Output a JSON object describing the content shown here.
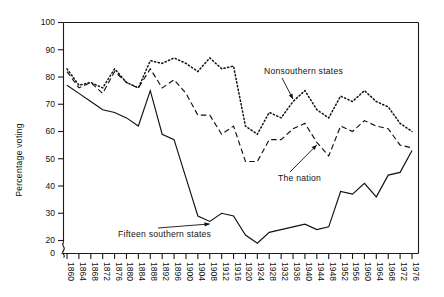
{
  "chart_data": {
    "type": "line",
    "title": "",
    "xlabel": "",
    "ylabel": "Percentage voting",
    "ylim": [
      20,
      100
    ],
    "y_axis_break_to_zero": true,
    "grid": false,
    "legend_position": "inline-annotations",
    "x": [
      1860,
      1864,
      1868,
      1872,
      1876,
      1880,
      1884,
      1888,
      1892,
      1896,
      1900,
      1904,
      1908,
      1912,
      1916,
      1920,
      1924,
      1928,
      1932,
      1936,
      1940,
      1944,
      1948,
      1952,
      1956,
      1960,
      1964,
      1968,
      1972,
      1976
    ],
    "categories": [
      "1860",
      "1864",
      "1868",
      "1872",
      "1876",
      "1880",
      "1884",
      "1888",
      "1892",
      "1896",
      "1900",
      "1904",
      "1908",
      "1912",
      "1916",
      "1920",
      "1924",
      "1928",
      "1932",
      "1936",
      "1940",
      "1944",
      "1948",
      "1952",
      "1956",
      "1960",
      "1964",
      "1968",
      "1972",
      "1976"
    ],
    "y_ticks": [
      0,
      20,
      30,
      40,
      50,
      60,
      70,
      80,
      90,
      100
    ],
    "y_tick_labels": [
      "0",
      "20",
      "30",
      "40",
      "50",
      "60",
      "70",
      "80",
      "90",
      "100"
    ],
    "series": [
      {
        "name": "Nonsouthern states",
        "style": "dotted",
        "values": [
          83,
          77,
          78,
          76,
          83,
          78,
          76,
          86,
          85,
          87,
          85,
          82,
          87,
          83,
          84,
          62,
          59,
          67,
          65,
          71,
          75,
          68,
          65,
          73,
          71,
          75,
          71,
          69,
          63,
          60
        ]
      },
      {
        "name": "The nation",
        "style": "dashed",
        "values": [
          82,
          76,
          78,
          74,
          82,
          78,
          76,
          83,
          76,
          79,
          74,
          66,
          66,
          59,
          62,
          49,
          49,
          57,
          57,
          61,
          63,
          56,
          51,
          62,
          60,
          64,
          62,
          61,
          55,
          54
        ]
      },
      {
        "name": "Fifteen southern states",
        "style": "solid",
        "values": [
          77,
          74,
          71,
          68,
          67,
          65,
          62,
          75,
          59,
          57,
          43,
          29,
          27,
          30,
          29,
          22,
          19,
          23,
          24,
          25,
          26,
          24,
          25,
          38,
          37,
          41,
          36,
          44,
          45,
          53
        ]
      }
    ],
    "annotations": [
      {
        "label": "Nonsouthern states",
        "target_series": "Nonsouthern states",
        "target_year": 1936
      },
      {
        "label": "The nation",
        "target_series": "The nation",
        "target_year": 1944
      },
      {
        "label": "Fifteen southern states",
        "target_series": "Fifteen southern states",
        "target_year": 1908
      }
    ]
  },
  "colors": {
    "line": "#111111",
    "axis": "#1a1a1a",
    "background": "#ffffff"
  }
}
